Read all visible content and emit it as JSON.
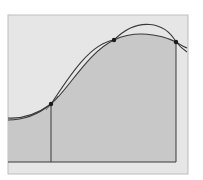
{
  "diagram": {
    "title": "",
    "colors": {
      "page_background": "#ffffff",
      "frame_fill": "#e6e6e6",
      "frame_stroke": "#bdbdbd",
      "area_fill": "#c8c8c8",
      "curve_stroke": "#3a3a3a",
      "point_fill": "#1a1a1a"
    },
    "frame": {
      "x": 8,
      "y": 15,
      "width": 180,
      "height": 159
    },
    "baseline_y": 162,
    "shaded_region": {
      "x_start": 8,
      "x_end": 176
    },
    "vertical_lines": [
      {
        "x": 51,
        "y_top": 104,
        "y_bottom": 162
      },
      {
        "x": 176,
        "y_top": 42,
        "y_bottom": 162
      }
    ],
    "points": [
      {
        "label": "P0",
        "x": 51,
        "y": 104
      },
      {
        "label": "P1",
        "x": 114,
        "y": 40
      },
      {
        "label": "P2",
        "x": 176,
        "y": 42
      }
    ],
    "curves": [
      {
        "name": "function-curve",
        "path": "M8,118 C25,119 40,112 51,104 C68,90 88,52 114,40 C135,30 160,34 176,42 C181,45 184,47 187,48"
      },
      {
        "name": "approximating-parabola",
        "path": "M8,120 C25,120 40,113 51,104 C66,82 88,44 114,40 C138,16 165,22 176,42 C181,48 184,50 187,52"
      }
    ]
  }
}
